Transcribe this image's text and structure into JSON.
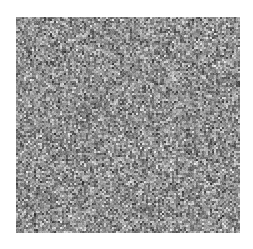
{
  "image": {
    "description": "Grayscale random noise texture",
    "canvas": {
      "width": 253,
      "height": 249,
      "background": "#ffffff"
    },
    "noise_region": {
      "x": 16,
      "y": 17,
      "width": 224,
      "height": 216
    },
    "noise": {
      "mode": "grayscale",
      "min_value": 40,
      "max_value": 245,
      "mean_value": 150,
      "grain_px": 2,
      "seed": 1337
    }
  }
}
